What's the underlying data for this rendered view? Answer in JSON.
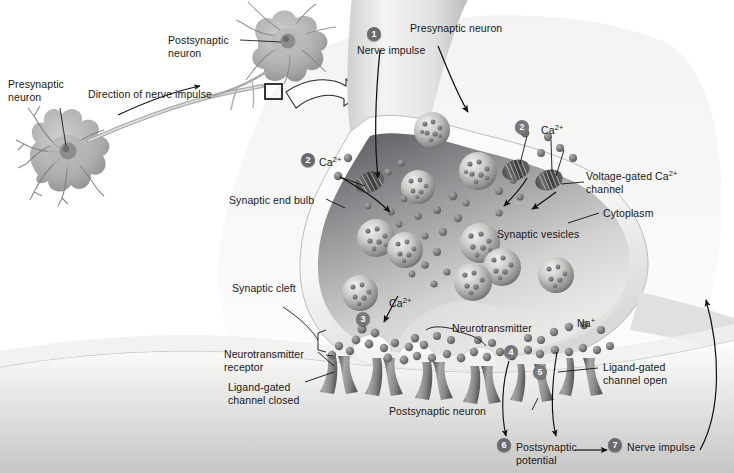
{
  "figure": {
    "background": "#ffffff",
    "badge_color": "#6a6a6e",
    "text_color": "#17171a"
  },
  "inset": {
    "presynaptic_label": "Presynaptic\nneuron",
    "postsynaptic_label": "Postsynaptic\nneuron",
    "direction_label": "Direction of nerve impulse"
  },
  "labels": {
    "presynaptic_neuron": "Presynaptic neuron",
    "nerve_impulse_1": "Nerve impulse",
    "calcium_left": "Ca",
    "calcium_left_sup": "2+",
    "calcium_right": "Ca",
    "calcium_right_sup": "2+",
    "calcium_mid": "Ca",
    "calcium_mid_sup": "2+",
    "voltage_gated_line1": "Voltage-gated Ca",
    "voltage_gated_sup": "2+",
    "voltage_gated_line2": "channel",
    "cytoplasm": "Cytoplasm",
    "synaptic_vesicles": "Synaptic vesicles",
    "synaptic_end_bulb": "Synaptic end bulb",
    "synaptic_cleft": "Synaptic cleft",
    "neurotransmitter": "Neurotransmitter",
    "neurotransmitter_receptor_l1": "Neurotransmitter",
    "neurotransmitter_receptor_l2": "receptor",
    "ligand_closed_l1": "Ligand-gated",
    "ligand_closed_l2": "channel closed",
    "ligand_open_l1": "Ligand-gated",
    "ligand_open_l2": "channel open",
    "postsynaptic_neuron": "Postsynaptic neuron",
    "sodium": "Na",
    "sodium_sup": "+",
    "postsynaptic_potential_l1": "Postsynaptic",
    "postsynaptic_potential_l2": "potential",
    "nerve_impulse_7": "Nerve impulse"
  },
  "steps": {
    "s1": "1",
    "s2a": "2",
    "s2b": "2",
    "s3": "3",
    "s4": "4",
    "s5": "5",
    "s6": "6",
    "s7": "7"
  }
}
